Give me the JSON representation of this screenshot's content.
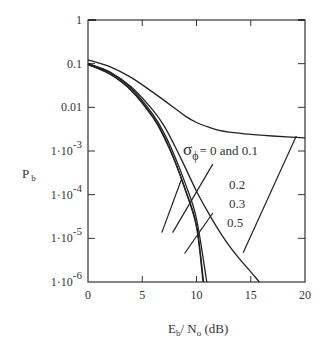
{
  "chart_data": {
    "type": "line",
    "title": "",
    "xlabel": "E_b / N_o (dB)",
    "xlabel_parts": {
      "main1": "E",
      "sub1": "b",
      "mid": "/ N",
      "sub2": "o",
      "tail": " (dB)"
    },
    "ylabel": "P_b",
    "ylabel_parts": {
      "main": "P",
      "sub": "b"
    },
    "x_scale": "linear",
    "y_scale": "log",
    "xlim": [
      0,
      20
    ],
    "ylim": [
      1e-06,
      1
    ],
    "x_ticks": [
      0,
      5,
      10,
      15,
      20
    ],
    "x_tick_labels": [
      "0",
      "5",
      "10",
      "15",
      "20"
    ],
    "y_ticks": [
      1,
      0.1,
      0.01,
      0.001,
      0.0001,
      1e-05,
      1e-06
    ],
    "y_tick_labels": [
      {
        "plain": "1"
      },
      {
        "plain": "0.1"
      },
      {
        "plain": "0.01"
      },
      {
        "base": "1·10",
        "exp": "-3"
      },
      {
        "base": "1·10",
        "exp": "-4"
      },
      {
        "base": "1·10",
        "exp": "-5"
      },
      {
        "base": "1·10",
        "exp": "-6"
      }
    ],
    "grid": false,
    "legend": "none",
    "series": [
      {
        "name": "sigma_phi = 0",
        "x": [
          0,
          2,
          4,
          6,
          7,
          8,
          9,
          10,
          10.6
        ],
        "y": [
          0.095,
          0.058,
          0.024,
          0.0058,
          0.0021,
          0.00058,
          0.00012,
          1.8e-05,
          1e-06
        ]
      },
      {
        "name": "sigma_phi = 0.1",
        "x": [
          0,
          2,
          4,
          6,
          7,
          8,
          9,
          10,
          10.65
        ],
        "y": [
          0.096,
          0.059,
          0.0245,
          0.006,
          0.0022,
          0.0006,
          0.000125,
          2e-05,
          1e-06
        ]
      },
      {
        "name": "sigma_phi = 0.2",
        "x": [
          0,
          2,
          4,
          6,
          7,
          8,
          9,
          10,
          10.95
        ],
        "y": [
          0.1,
          0.063,
          0.027,
          0.0068,
          0.0026,
          0.00075,
          0.00017,
          2.8e-05,
          1e-06
        ]
      },
      {
        "name": "sigma_phi = 0.3",
        "x": [
          0,
          2,
          4,
          6,
          7,
          8,
          9,
          10,
          11,
          12,
          13,
          14,
          15,
          15.8
        ],
        "y": [
          0.1,
          0.065,
          0.029,
          0.0085,
          0.0038,
          0.0013,
          0.0004,
          0.00012,
          4.2e-05,
          1.6e-05,
          6.8e-06,
          3.3e-06,
          1.7e-06,
          1e-06
        ]
      },
      {
        "name": "sigma_phi = 0.5",
        "x": [
          0,
          2,
          4,
          6,
          8,
          9,
          10,
          11,
          12,
          13,
          15,
          17,
          20
        ],
        "y": [
          0.122,
          0.085,
          0.048,
          0.022,
          0.0095,
          0.0062,
          0.0045,
          0.0036,
          0.003,
          0.0027,
          0.0024,
          0.0022,
          0.002
        ]
      }
    ],
    "annotations": [
      {
        "symbol": "σ",
        "sub": "ϕ",
        "text": "= 0 and 0.1",
        "points_to": "sigma_phi = 0 / 0.1",
        "leader_from": [
          8.6,
          0.00022
        ],
        "leader_to": [
          6.8,
          1.35e-05
        ]
      },
      {
        "text": "0.2",
        "points_to": "sigma_phi = 0.2",
        "leader_from": [
          11.5,
          0.0005
        ],
        "leader_to": [
          7.8,
          1.35e-05
        ]
      },
      {
        "text": "0.3",
        "points_to": "sigma_phi = 0.3",
        "leader_from": [
          11.5,
          3.8e-05
        ],
        "leader_to": [
          8.9,
          4.5e-06
        ]
      },
      {
        "text": "0.5",
        "points_to": "sigma_phi = 0.5",
        "leader_from": [
          19.2,
          0.0022
        ],
        "leader_to": [
          14.3,
          4.7e-06
        ]
      }
    ]
  }
}
